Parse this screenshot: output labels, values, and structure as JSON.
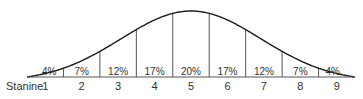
{
  "chart_data": {
    "type": "area",
    "title": "",
    "subtitle": "",
    "xlabel": "Stanine",
    "ylabel": "",
    "categories": [
      "1",
      "2",
      "3",
      "4",
      "5",
      "6",
      "7",
      "8",
      "9"
    ],
    "values": [
      4,
      7,
      12,
      17,
      20,
      17,
      12,
      7,
      4
    ],
    "value_labels": [
      "4%",
      "7%",
      "12%",
      "17%",
      "20%",
      "17%",
      "12%",
      "7%",
      "4%"
    ],
    "unit": "%",
    "grid": false,
    "legend": null,
    "colors": {
      "line": "#1a1a1a",
      "divider": "#555555",
      "text": "#333333",
      "background": "#ffffff"
    }
  },
  "axis": {
    "label": "Stanine"
  }
}
